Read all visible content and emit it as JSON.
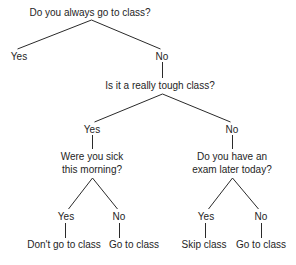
{
  "diagram": {
    "type": "decision-tree",
    "colors": {
      "text": "#1e1e1e",
      "edge": "#2a2a2a",
      "background": "#ffffff"
    },
    "nodes": [
      {
        "id": "q1",
        "kind": "question",
        "lines": [
          "Do you always go to class?"
        ],
        "x": 90,
        "y": 7
      },
      {
        "id": "q1_yes",
        "kind": "answer",
        "lines": [
          "Yes"
        ],
        "x": 19,
        "y": 51
      },
      {
        "id": "q1_no",
        "kind": "answer",
        "lines": [
          "No"
        ],
        "x": 162,
        "y": 51
      },
      {
        "id": "q2",
        "kind": "question",
        "lines": [
          "Is it a really tough class?"
        ],
        "x": 160,
        "y": 80
      },
      {
        "id": "q2_yes",
        "kind": "answer",
        "lines": [
          "Yes"
        ],
        "x": 92,
        "y": 124
      },
      {
        "id": "q2_no",
        "kind": "answer",
        "lines": [
          "No"
        ],
        "x": 232,
        "y": 124
      },
      {
        "id": "q3",
        "kind": "question",
        "lines": [
          "Were you sick",
          "this morning?"
        ],
        "x": 92,
        "y": 151
      },
      {
        "id": "q4",
        "kind": "question",
        "lines": [
          "Do you have an",
          "exam later today?"
        ],
        "x": 232,
        "y": 151
      },
      {
        "id": "q3_yes",
        "kind": "answer",
        "lines": [
          "Yes"
        ],
        "x": 66,
        "y": 211
      },
      {
        "id": "q3_no",
        "kind": "answer",
        "lines": [
          "No"
        ],
        "x": 119,
        "y": 211
      },
      {
        "id": "q4_yes",
        "kind": "answer",
        "lines": [
          "Yes"
        ],
        "x": 206,
        "y": 211
      },
      {
        "id": "q4_no",
        "kind": "answer",
        "lines": [
          "No"
        ],
        "x": 261,
        "y": 211
      },
      {
        "id": "out1",
        "kind": "outcome",
        "lines": [
          "Don't go to class"
        ],
        "x": 64,
        "y": 239
      },
      {
        "id": "out2",
        "kind": "outcome",
        "lines": [
          "Go to class"
        ],
        "x": 134,
        "y": 239
      },
      {
        "id": "out3",
        "kind": "outcome",
        "lines": [
          "Skip class"
        ],
        "x": 204,
        "y": 239
      },
      {
        "id": "out4",
        "kind": "outcome",
        "lines": [
          "Go to class"
        ],
        "x": 261,
        "y": 239
      }
    ],
    "edges": [
      {
        "from": "q1",
        "to": "q1_yes",
        "x1": 91,
        "y1": 20,
        "x2": 17,
        "y2": 49
      },
      {
        "from": "q1",
        "to": "q1_no",
        "x1": 91,
        "y1": 20,
        "x2": 160,
        "y2": 49
      },
      {
        "from": "q1_no",
        "to": "q2",
        "x1": 162,
        "y1": 62,
        "x2": 162,
        "y2": 78
      },
      {
        "from": "q2",
        "to": "q2_yes",
        "x1": 162,
        "y1": 94,
        "x2": 94,
        "y2": 122
      },
      {
        "from": "q2",
        "to": "q2_no",
        "x1": 162,
        "y1": 94,
        "x2": 230,
        "y2": 122
      },
      {
        "from": "q2_yes",
        "to": "q3",
        "x1": 92,
        "y1": 135,
        "x2": 92,
        "y2": 149
      },
      {
        "from": "q2_no",
        "to": "q4",
        "x1": 232,
        "y1": 135,
        "x2": 232,
        "y2": 149
      },
      {
        "from": "q3",
        "to": "q3_yes",
        "x1": 92,
        "y1": 178,
        "x2": 68,
        "y2": 209
      },
      {
        "from": "q3",
        "to": "q3_no",
        "x1": 92,
        "y1": 178,
        "x2": 117,
        "y2": 209
      },
      {
        "from": "q4",
        "to": "q4_yes",
        "x1": 232,
        "y1": 178,
        "x2": 208,
        "y2": 209
      },
      {
        "from": "q4",
        "to": "q4_no",
        "x1": 232,
        "y1": 178,
        "x2": 258,
        "y2": 209
      },
      {
        "from": "q3_yes",
        "to": "out1",
        "x1": 65,
        "y1": 223,
        "x2": 65,
        "y2": 238
      },
      {
        "from": "q3_no",
        "to": "out2",
        "x1": 119,
        "y1": 223,
        "x2": 119,
        "y2": 238
      },
      {
        "from": "q4_yes",
        "to": "out3",
        "x1": 205,
        "y1": 223,
        "x2": 205,
        "y2": 238
      },
      {
        "from": "q4_no",
        "to": "out4",
        "x1": 261,
        "y1": 223,
        "x2": 261,
        "y2": 238
      }
    ]
  }
}
